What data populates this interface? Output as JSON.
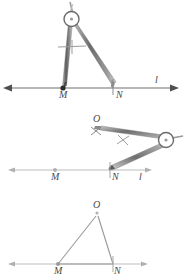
{
  "figure": {
    "panels": [
      {
        "id": "step-1",
        "description": "Compass opened with point on M and pencil on N, measuring segment MN on line l",
        "line_label": "l",
        "points": [
          {
            "name": "M",
            "label": "M",
            "x": 63,
            "y": 88,
            "style": "filled-dot"
          },
          {
            "name": "N",
            "label": "N",
            "x": 113,
            "y": 88,
            "style": "tick"
          }
        ],
        "tool": "compass",
        "tool_state": "spanning M to N"
      },
      {
        "id": "step-2",
        "description": "Compass pivoted at N, drawing an arc that locates point O above the line",
        "line_label": "l",
        "points": [
          {
            "name": "M",
            "label": "M",
            "x": 55,
            "y": 170,
            "style": "open-dot"
          },
          {
            "name": "N",
            "label": "N",
            "x": 110,
            "y": 170,
            "style": "tick"
          },
          {
            "name": "O",
            "label": "O",
            "x": 97,
            "y": 131,
            "style": "x-mark"
          }
        ],
        "tool": "compass",
        "tool_state": "pivoted at N, arc marks O"
      },
      {
        "id": "step-3",
        "description": "Completed triangle MNO with vertices joined by segments",
        "line_label": "",
        "points": [
          {
            "name": "M",
            "label": "M",
            "x": 57,
            "y": 270,
            "style": "open-dot"
          },
          {
            "name": "N",
            "label": "N",
            "x": 112,
            "y": 270,
            "style": "tick"
          },
          {
            "name": "O",
            "label": "O",
            "x": 97,
            "y": 212,
            "style": "open-circle"
          }
        ],
        "segments": [
          "MO",
          "NO",
          "MN"
        ],
        "tool": "none",
        "tool_state": "construction complete"
      }
    ],
    "labels": {
      "M": "M",
      "N": "N",
      "O": "O",
      "line": "l"
    },
    "colors": {
      "line_dark": "#6e6e6e",
      "line_light": "#b9b9b9",
      "compass_metal": "#8a8a8a",
      "compass_metal_dark": "#5f5f5f",
      "label_text": "#4a4a4a",
      "background": "#ffffff"
    }
  }
}
